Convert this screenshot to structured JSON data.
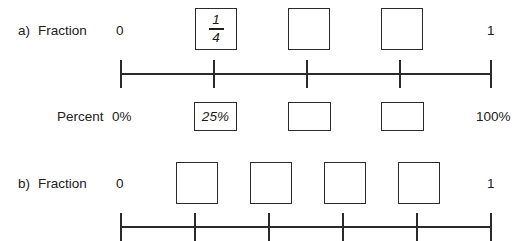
{
  "worksheet": {
    "background_color": "#ffffff",
    "ink_color": "#2a2a2a"
  },
  "rows": [
    {
      "id": "row-a",
      "marker": "a)",
      "label": "Fraction",
      "start_label": "0",
      "end_label": "1",
      "boxes": [
        {
          "value_numerator": "1",
          "value_denominator": "4",
          "filled": true
        },
        {
          "value_numerator": "",
          "value_denominator": "",
          "filled": false
        },
        {
          "value_numerator": "",
          "value_denominator": "",
          "filled": false
        }
      ],
      "number_line": {
        "tick_count": 5,
        "tick_fractions": [
          0,
          0.25,
          0.5,
          0.75,
          1
        ],
        "tick_labels": [
          "0",
          "1/4",
          "2/4",
          "3/4",
          "1"
        ]
      }
    },
    {
      "id": "row-percent",
      "marker": "",
      "label": "Percent",
      "start_label": "0%",
      "end_label": "100%",
      "boxes": [
        {
          "value": "25%",
          "filled": true
        },
        {
          "value": "",
          "filled": false
        },
        {
          "value": "",
          "filled": false
        }
      ]
    },
    {
      "id": "row-b",
      "marker": "b)",
      "label": "Fraction",
      "start_label": "0",
      "end_label": "1",
      "boxes": [
        {
          "value_numerator": "",
          "value_denominator": "",
          "filled": false
        },
        {
          "value_numerator": "",
          "value_denominator": "",
          "filled": false
        },
        {
          "value_numerator": "",
          "value_denominator": "",
          "filled": false
        },
        {
          "value_numerator": "",
          "value_denominator": "",
          "filled": false
        }
      ],
      "number_line": {
        "tick_count": 6,
        "tick_fractions": [
          0,
          0.2,
          0.4,
          0.6,
          0.8,
          1
        ],
        "tick_labels": [
          "0",
          "1/5",
          "2/5",
          "3/5",
          "4/5",
          "1"
        ]
      }
    }
  ]
}
